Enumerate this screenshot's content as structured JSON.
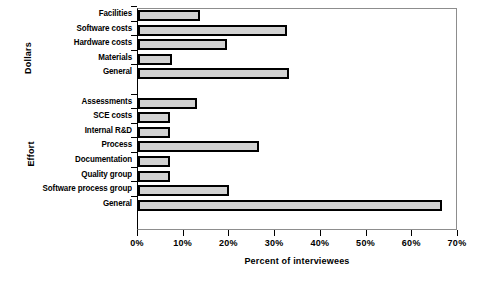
{
  "chart_data": {
    "type": "bar",
    "orientation": "horizontal",
    "title": "",
    "xlabel": "Percent of interviewees",
    "ylabel": "",
    "xlim": [
      0,
      70
    ],
    "xticks": [
      "0%",
      "10%",
      "20%",
      "30%",
      "40%",
      "50%",
      "60%",
      "70%"
    ],
    "xtick_values": [
      0,
      10,
      20,
      30,
      40,
      50,
      60,
      70
    ],
    "grid": false,
    "legend": "none",
    "groups": [
      {
        "name": "Dollars",
        "categories": [
          "Facilities",
          "Software costs",
          "Hardware costs",
          "Materials",
          "General"
        ],
        "values": [
          13.5,
          32.5,
          19.5,
          7.5,
          33
        ]
      },
      {
        "name": "Effort",
        "categories": [
          "Assessments",
          "SCE costs",
          "Internal R&D",
          "Process",
          "Documentation",
          "Quality group",
          "Software process group",
          "General"
        ],
        "values": [
          13,
          7,
          7,
          26.5,
          7,
          7,
          20,
          66.5
        ]
      }
    ],
    "categories": [
      "Facilities",
      "Software costs",
      "Hardware costs",
      "Materials",
      "General",
      "Assessments",
      "SCE costs",
      "Internal R&D",
      "Process",
      "Documentation",
      "Quality group",
      "Software process group",
      "General"
    ],
    "values": [
      13.5,
      32.5,
      19.5,
      7.5,
      33,
      13,
      7,
      7,
      26.5,
      7,
      7,
      20,
      66.5
    ],
    "bar_fill_color": "#d2d2d2",
    "bar_edge_color": "#000000"
  }
}
